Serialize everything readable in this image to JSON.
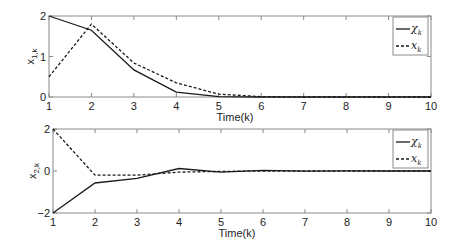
{
  "chart_data": [
    {
      "type": "line",
      "title": "",
      "xlabel": "Time(k)",
      "ylabel": "x_{1,k}",
      "ylabel_main": "x",
      "ylabel_sub": "1,k",
      "x": [
        1,
        2,
        3,
        4,
        5,
        6,
        7,
        8,
        9,
        10
      ],
      "xlim": [
        1,
        10
      ],
      "ylim": [
        0,
        2
      ],
      "xticks": [
        1,
        2,
        3,
        4,
        5,
        6,
        7,
        8,
        9,
        10
      ],
      "yticks": [
        0,
        1,
        2
      ],
      "grid": false,
      "legend_position": "upper right",
      "series": [
        {
          "name": "χ_k",
          "label_main": "χ",
          "label_sub": "k",
          "style": "solid",
          "values": [
            2.0,
            1.65,
            0.67,
            0.12,
            0.01,
            0.0,
            0.0,
            0.0,
            0.0,
            0.0
          ]
        },
        {
          "name": "x_k",
          "label_main": "x",
          "label_sub": "k",
          "style": "dashed",
          "values": [
            0.5,
            1.8,
            0.84,
            0.35,
            0.07,
            0.01,
            0.0,
            0.0,
            0.0,
            0.0
          ]
        }
      ]
    },
    {
      "type": "line",
      "title": "",
      "xlabel": "Time(k)",
      "ylabel": "x_{2,k}",
      "ylabel_main": "x",
      "ylabel_sub": "2,k",
      "x": [
        1,
        2,
        3,
        4,
        5,
        6,
        7,
        8,
        9,
        10
      ],
      "xlim": [
        1,
        10
      ],
      "ylim": [
        -2,
        2
      ],
      "xticks": [
        1,
        2,
        3,
        4,
        5,
        6,
        7,
        8,
        9,
        10
      ],
      "yticks": [
        -2,
        0,
        2
      ],
      "grid": false,
      "legend_position": "upper right",
      "series": [
        {
          "name": "χ_k",
          "label_main": "χ",
          "label_sub": "k",
          "style": "solid",
          "values": [
            -2.0,
            -0.57,
            -0.35,
            0.12,
            -0.05,
            0.03,
            -0.01,
            0.01,
            0.0,
            0.0
          ]
        },
        {
          "name": "x_k",
          "label_main": "x",
          "label_sub": "k",
          "style": "dashed",
          "values": [
            2.0,
            -0.2,
            -0.2,
            -0.05,
            -0.02,
            0.0,
            0.0,
            0.0,
            0.0,
            0.0
          ]
        }
      ]
    }
  ]
}
